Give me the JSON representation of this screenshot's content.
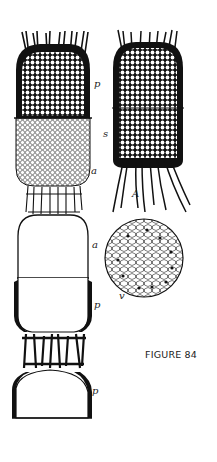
{
  "figure": {
    "caption": "FIGURE 84",
    "ink_color": "#111111",
    "paper_color": "#ffffff",
    "left_specimen": {
      "labels": [
        {
          "id": "p-top",
          "text": "p"
        },
        {
          "id": "s",
          "text": "s"
        },
        {
          "id": "a-1",
          "text": "a"
        },
        {
          "id": "a-2",
          "text": "a"
        },
        {
          "id": "p-mid",
          "text": "p"
        },
        {
          "id": "p-bottom",
          "text": "p"
        }
      ]
    },
    "right_specimen": {
      "label": "A"
    },
    "cross_section": {
      "label": "v"
    }
  }
}
